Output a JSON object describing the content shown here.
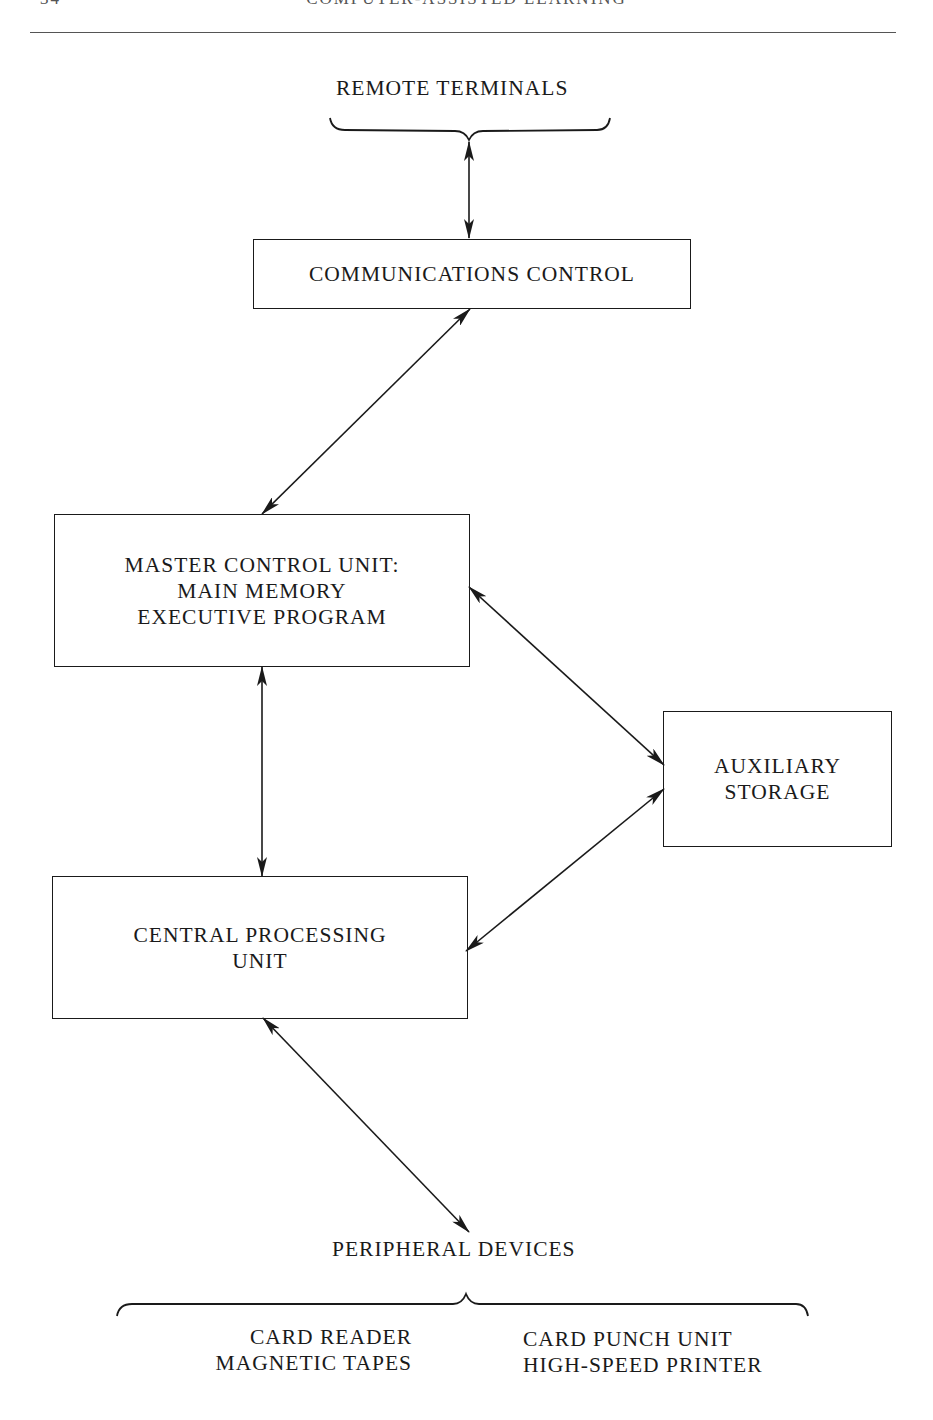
{
  "page": {
    "running_head": "COMPUTER-ASSISTED LEARNING",
    "page_number": "34"
  },
  "diagram": {
    "remote_terminals": "REMOTE TERMINALS",
    "communications_control": "COMMUNICATIONS CONTROL",
    "master_control_unit": {
      "line1": "MASTER CONTROL UNIT:",
      "line2": "MAIN MEMORY",
      "line3": "EXECUTIVE PROGRAM"
    },
    "auxiliary_storage": {
      "line1": "AUXILIARY",
      "line2": "STORAGE"
    },
    "central_processing_unit": {
      "line1": "CENTRAL PROCESSING",
      "line2": "UNIT"
    },
    "peripheral_devices": {
      "title": "PERIPHERAL DEVICES",
      "left": [
        "CARD READER",
        "MAGNETIC TAPES"
      ],
      "right": [
        "CARD PUNCH UNIT",
        "HIGH-SPEED PRINTER"
      ]
    },
    "connections": [
      {
        "from": "REMOTE TERMINALS",
        "to": "COMMUNICATIONS CONTROL",
        "type": "bidirectional"
      },
      {
        "from": "COMMUNICATIONS CONTROL",
        "to": "MASTER CONTROL UNIT",
        "type": "bidirectional"
      },
      {
        "from": "MASTER CONTROL UNIT",
        "to": "CENTRAL PROCESSING UNIT",
        "type": "bidirectional"
      },
      {
        "from": "MASTER CONTROL UNIT",
        "to": "AUXILIARY STORAGE",
        "type": "bidirectional"
      },
      {
        "from": "CENTRAL PROCESSING UNIT",
        "to": "AUXILIARY STORAGE",
        "type": "bidirectional"
      },
      {
        "from": "CENTRAL PROCESSING UNIT",
        "to": "PERIPHERAL DEVICES",
        "type": "bidirectional"
      }
    ]
  }
}
